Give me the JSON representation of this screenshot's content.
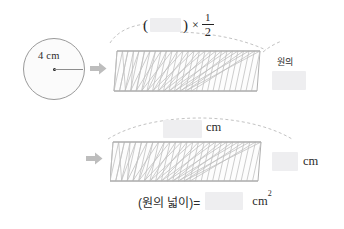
{
  "worksheet": {
    "subject": "circle-area-derivation",
    "language": "ko"
  },
  "circle": {
    "radius_label": "4 cm",
    "radius_value": 4,
    "unit": "cm",
    "stroke_color": "#9a9a9a",
    "fill_color": "#fbfbfb"
  },
  "arrows": {
    "first_label": "arrow-right",
    "second_label": "arrow-right",
    "color": "#bdbdbd"
  },
  "row1": {
    "formula": {
      "open_paren": "(",
      "blank": "",
      "close_paren": ")",
      "times": "×",
      "fraction_numerator": "1",
      "fraction_denominator": "2"
    },
    "right_label": "원의",
    "right_blank": "",
    "shape": {
      "name": "sector-strip-parallelogram",
      "teeth": 26
    }
  },
  "row2": {
    "top_blank": "",
    "top_unit": "cm",
    "side_blank": "",
    "side_unit": "cm",
    "shape": {
      "name": "sector-strip-parallelogram",
      "teeth": 26
    }
  },
  "result": {
    "label": "(원의 넓이)=",
    "blank": "",
    "unit": "cm",
    "exponent": "2"
  },
  "colors": {
    "blank_fill": "#eeeef0",
    "ink": "#2b2b2b",
    "shape_line": "#b3b3b3",
    "dash_line": "#c3c3c3"
  }
}
